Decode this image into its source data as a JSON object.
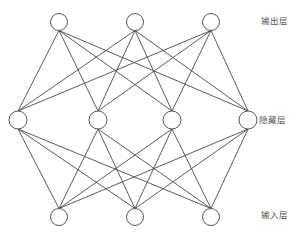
{
  "diagram": {
    "type": "neural-network",
    "colors": {
      "background": "#ffffff",
      "edge": "#4a4a4a",
      "node_stroke": "#555555",
      "node_fill": "#ffffff",
      "label": "#555555"
    },
    "layers": [
      {
        "id": "output",
        "label": "输出层",
        "label_pos": {
          "x": 261,
          "y": 16
        },
        "nodes": [
          {
            "id": "o1",
            "x": 59,
            "y": 22,
            "r": 8.5
          },
          {
            "id": "o2",
            "x": 135,
            "y": 22,
            "r": 8.5
          },
          {
            "id": "o3",
            "x": 211,
            "y": 22,
            "r": 8.5
          }
        ]
      },
      {
        "id": "hidden",
        "label": "隐藏层",
        "label_pos": {
          "x": 259,
          "y": 115
        },
        "nodes": [
          {
            "id": "h1",
            "x": 18,
            "y": 120,
            "r": 9
          },
          {
            "id": "h2",
            "x": 98,
            "y": 120,
            "r": 9
          },
          {
            "id": "h3",
            "x": 172,
            "y": 120,
            "r": 9
          },
          {
            "id": "h4",
            "x": 248,
            "y": 120,
            "r": 9
          }
        ]
      },
      {
        "id": "input",
        "label": "输入层",
        "label_pos": {
          "x": 261,
          "y": 210
        },
        "nodes": [
          {
            "id": "i1",
            "x": 59,
            "y": 217,
            "r": 8.5
          },
          {
            "id": "i2",
            "x": 135,
            "y": 217,
            "r": 8.5
          },
          {
            "id": "i3",
            "x": 211,
            "y": 217,
            "r": 8.5
          }
        ]
      }
    ],
    "connections": [
      {
        "from_layer": "output",
        "to_layer": "hidden",
        "pattern": "fully-connected"
      },
      {
        "from_layer": "hidden",
        "to_layer": "input",
        "pattern": "fully-connected"
      }
    ]
  }
}
